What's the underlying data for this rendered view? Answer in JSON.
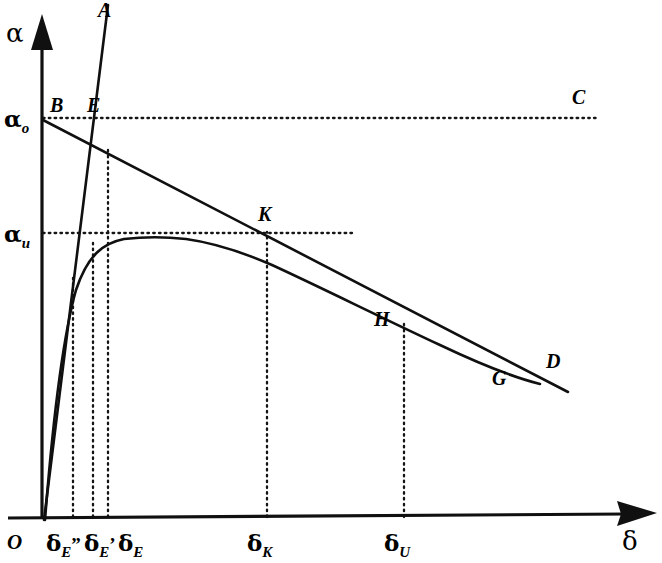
{
  "figure": {
    "type": "line-diagram",
    "background_color": "#ffffff",
    "ink_color": "#101010",
    "axes": {
      "y_axis_label": "α",
      "x_axis_label": "δ",
      "origin_label": "O",
      "y_arrow": "up-arrow-head",
      "x_arrow": "right-arrow-head"
    },
    "y_ticks": [
      {
        "id": "alpha-0",
        "base": "α",
        "sub": "o",
        "value_px_y": 118
      },
      {
        "id": "alpha-u",
        "base": "α",
        "sub": "u",
        "value_px_y": 233
      }
    ],
    "x_ticks": [
      {
        "id": "delta-E-double-prime",
        "base": "δ",
        "sub": "E",
        "prime": "”",
        "value_px_x": 73
      },
      {
        "id": "delta-E-prime",
        "base": "δ",
        "sub": "E",
        "prime": "’",
        "value_px_x": 93
      },
      {
        "id": "delta-E",
        "base": "δ",
        "sub": "E",
        "prime": "",
        "value_px_x": 108
      },
      {
        "id": "delta-K",
        "base": "δ",
        "sub": "K",
        "prime": "",
        "value_px_x": 267
      },
      {
        "id": "delta-U",
        "base": "δ",
        "sub": "U",
        "prime": "",
        "value_px_x": 404
      }
    ],
    "point_labels": [
      {
        "id": "A",
        "text": "A",
        "x": 98,
        "y": 17,
        "note": "top of steep straight line through origin"
      },
      {
        "id": "B",
        "text": "B",
        "x": 50,
        "y": 112,
        "note": "left end of descending line on alpha axis at alpha-o"
      },
      {
        "id": "E",
        "text": "E",
        "x": 87,
        "y": 112,
        "note": "near intersection of line A with alpha-o level"
      },
      {
        "id": "C",
        "text": "C",
        "x": 572,
        "y": 104,
        "note": "right end of alpha-o dotted horizontal"
      },
      {
        "id": "K",
        "text": "K",
        "x": 258,
        "y": 221,
        "note": "intersection of descending line with alpha-u level"
      },
      {
        "id": "H",
        "text": "H",
        "x": 374,
        "y": 326,
        "note": "on descending line above delta-U"
      },
      {
        "id": "G",
        "text": "G",
        "x": 492,
        "y": 385,
        "note": "where curve merges into descending line"
      },
      {
        "id": "D",
        "text": "D",
        "x": 546,
        "y": 368,
        "note": "right end of descending line"
      }
    ],
    "curves": [
      {
        "id": "rising-saturating-curve",
        "description": "curve from origin rising steeply, peaking just under alpha-u near delta about 180px, then slowly descending to merge with line BD near G"
      },
      {
        "id": "line-A-steep",
        "description": "straight steep line from origin through E up to top of plot"
      },
      {
        "id": "line-BD-descending",
        "description": "straight line from B on the alpha axis at alpha-o descending to D at lower right"
      }
    ],
    "dotted_guides": [
      {
        "id": "alpha-o-horizontal",
        "from": "alpha axis",
        "to": "C"
      },
      {
        "id": "alpha-u-horizontal",
        "from": "alpha axis",
        "to": "K"
      },
      {
        "id": "delta-E-double-prime-vertical",
        "from": "x axis",
        "to": "curve"
      },
      {
        "id": "delta-E-prime-vertical",
        "from": "x axis",
        "to": "line A"
      },
      {
        "id": "delta-E-vertical",
        "from": "x axis",
        "to": "intersection E"
      },
      {
        "id": "delta-K-vertical",
        "from": "x axis",
        "to": "K"
      },
      {
        "id": "delta-U-vertical",
        "from": "x axis",
        "to": "H"
      }
    ]
  }
}
